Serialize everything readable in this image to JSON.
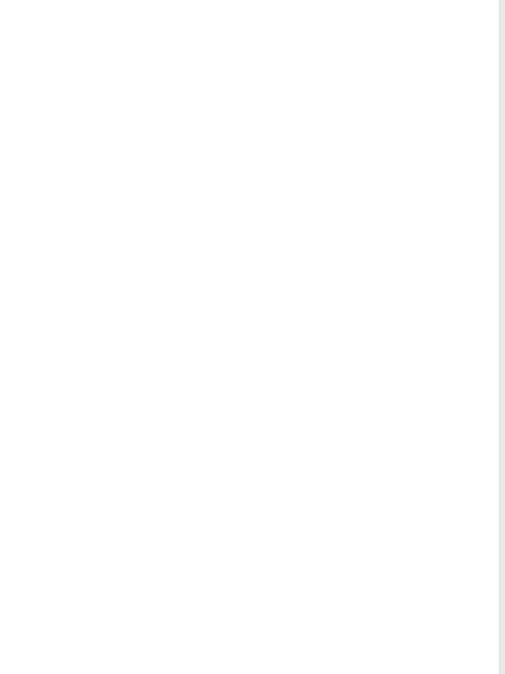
{
  "figure": {
    "orientation": "rotated 90 degrees counter-clockwise",
    "panels": [
      {
        "id": "a",
        "label": "a",
        "loop_top": "TGT",
        "strand_left": [
          "T",
          "C",
          "C",
          "C",
          "T",
          "G",
          "C",
          "C",
          "C",
          "G",
          "T",
          "A",
          "A",
          "T",
          "A",
          "A",
          "C",
          "T",
          "C",
          "G",
          "G",
          "A",
          "G",
          "G",
          "G",
          "T",
          "C",
          "C",
          "G",
          "C",
          "G"
        ],
        "strand_right": [
          "G",
          "T",
          "T",
          "A",
          "A",
          "C",
          "G",
          "G",
          "G",
          "C",
          "T",
          "T",
          "T",
          "A",
          "C",
          "A",
          "A",
          "T",
          "G",
          "T",
          "G",
          "TACA",
          "CAAC",
          "G",
          "C",
          "G",
          "G",
          "A",
          "G",
          "C",
          "G"
        ],
        "annotations": [
          "3' 26S",
          "5' ---TTT",
          "TTG",
          "TG-- 3'"
        ],
        "boxed_sequence": "TTG"
      },
      {
        "id": "b",
        "label": "b",
        "loop_top": "G G A",
        "pairs_text": "A C-G G-C G-C T C-G G A T G-C G-C G T G T G A T T-A T-A C-G T-A T G T-A C-G T-A T-A T A-T T-A T G T-A G T T-A T-A G-C T-A T-A T G A-T G-C",
        "annotations": [
          "3' 37S",
          "3' 26S",
          "5' --- G",
          "TTGTC",
          "CTAT --- 3'"
        ],
        "boxed_sequence": "TTGTC"
      },
      {
        "id": "c",
        "label": "c",
        "loop_top": "C C",
        "pairs_text": "C G-C C-G G-C G-C G A A-C G-C C-G G-C G-C A G C-G G-C G",
        "tail_top": "CGAC--- 3'",
        "single_strand": [
          "A",
          "G",
          "G",
          "A"
        ],
        "boxed_sequence": "GGCTGTT",
        "after_box": [
          "T",
          "T",
          "C",
          "G",
          "A",
          "A"
        ],
        "annotations": [
          "3' 28S",
          "5' ---"
        ]
      },
      {
        "id": "d",
        "label": "d",
        "loop_top": "G T C",
        "pairs_text": "C T-A T C G-C A C A A-T A-T A-T C-G A T C G T-A C T G G-C G T-A G A A C T-A A-T A A-T G A T-A A-T T-A A-T",
        "tail_top": "TAG--- 3'",
        "annotations": [
          "3' 28S",
          "5' ---GC",
          "TTGATG",
          "A",
          "T",
          "C",
          "G"
        ],
        "boxed_sequence": "TTGATG"
      }
    ]
  },
  "glyphs": {
    "d": [
      {
        "x": 131,
        "y": 97,
        "t": "G"
      },
      {
        "x": 131,
        "y": 104,
        "t": "C"
      },
      {
        "x": 140,
        "y": 97,
        "t": "T"
      },
      {
        "x": 140,
        "y": 104,
        "t": "T"
      },
      {
        "x": 145,
        "y": 90,
        "t": "C"
      },
      {
        "x": 150,
        "y": 104,
        "t": "A"
      },
      {
        "x": 160,
        "y": 97,
        "t": "C"
      },
      {
        "x": 160,
        "y": 104,
        "t": "T"
      },
      {
        "x": 170,
        "y": 97,
        "t": "C"
      },
      {
        "x": 170,
        "y": 104,
        "t": "G"
      },
      {
        "x": 180,
        "y": 97,
        "t": "A"
      },
      {
        "x": 180,
        "y": 104,
        "t": "C"
      },
      {
        "x": 190,
        "y": 97,
        "t": "C"
      },
      {
        "x": 190,
        "y": 104,
        "t": "A"
      },
      {
        "x": 200,
        "y": 97,
        "t": "A"
      },
      {
        "x": 200,
        "y": 104,
        "t": "T"
      },
      {
        "x": 210,
        "y": 97,
        "t": "A"
      },
      {
        "x": 210,
        "y": 104,
        "t": "T"
      },
      {
        "x": 220,
        "y": 97,
        "t": "A"
      },
      {
        "x": 220,
        "y": 104,
        "t": "T"
      },
      {
        "x": 230,
        "y": 97,
        "t": "C"
      },
      {
        "x": 230,
        "y": 104,
        "t": "G"
      },
      {
        "x": 238,
        "y": 90,
        "t": "A"
      },
      {
        "x": 245,
        "y": 97,
        "t": "C"
      },
      {
        "x": 250,
        "y": 90,
        "t": "T"
      },
      {
        "x": 255,
        "y": 97,
        "t": "G"
      },
      {
        "x": 260,
        "y": 90,
        "t": "G"
      },
      {
        "x": 265,
        "y": 97,
        "t": "T"
      },
      {
        "x": 270,
        "y": 90,
        "t": "C"
      },
      {
        "x": 272,
        "y": 104,
        "t": "A"
      },
      {
        "x": 280,
        "y": 97,
        "t": "T"
      },
      {
        "x": 285,
        "y": 90,
        "t": "G"
      },
      {
        "x": 290,
        "y": 97,
        "t": "G"
      },
      {
        "x": 297,
        "y": 90,
        "t": "C"
      },
      {
        "x": 300,
        "y": 104,
        "t": "G"
      },
      {
        "x": 310,
        "y": 97,
        "t": "T"
      },
      {
        "x": 310,
        "y": 104,
        "t": "A"
      },
      {
        "x": 320,
        "y": 90,
        "t": "G"
      },
      {
        "x": 325,
        "y": 97,
        "t": "A"
      },
      {
        "x": 330,
        "y": 90,
        "t": "G"
      },
      {
        "x": 335,
        "y": 97,
        "t": "A"
      },
      {
        "x": 345,
        "y": 90,
        "t": "C"
      },
      {
        "x": 345,
        "y": 104,
        "t": "A"
      },
      {
        "x": 355,
        "y": 97,
        "t": "T"
      },
      {
        "x": 355,
        "y": 104,
        "t": "A"
      },
      {
        "x": 365,
        "y": 97,
        "t": "A"
      },
      {
        "x": 365,
        "y": 104,
        "t": "T"
      },
      {
        "x": 375,
        "y": 90,
        "t": "A"
      },
      {
        "x": 380,
        "y": 104,
        "t": "A"
      },
      {
        "x": 390,
        "y": 97,
        "t": "A"
      },
      {
        "x": 390,
        "y": 104,
        "t": "T"
      },
      {
        "x": 398,
        "y": 90,
        "t": "G"
      },
      {
        "x": 403,
        "y": 104,
        "t": "A"
      },
      {
        "x": 410,
        "y": 97,
        "t": "T"
      },
      {
        "x": 410,
        "y": 104,
        "t": "A"
      },
      {
        "x": 420,
        "y": 97,
        "t": "A"
      },
      {
        "x": 420,
        "y": 104,
        "t": "T"
      },
      {
        "x": 430,
        "y": 97,
        "t": "T"
      },
      {
        "x": 430,
        "y": 104,
        "t": "A"
      },
      {
        "x": 440,
        "y": 97,
        "t": "A"
      },
      {
        "x": 440,
        "y": 104,
        "t": "T"
      },
      {
        "x": 450,
        "y": 104,
        "t": "G"
      },
      {
        "x": 460,
        "y": 110,
        "t": "C"
      }
    ]
  }
}
